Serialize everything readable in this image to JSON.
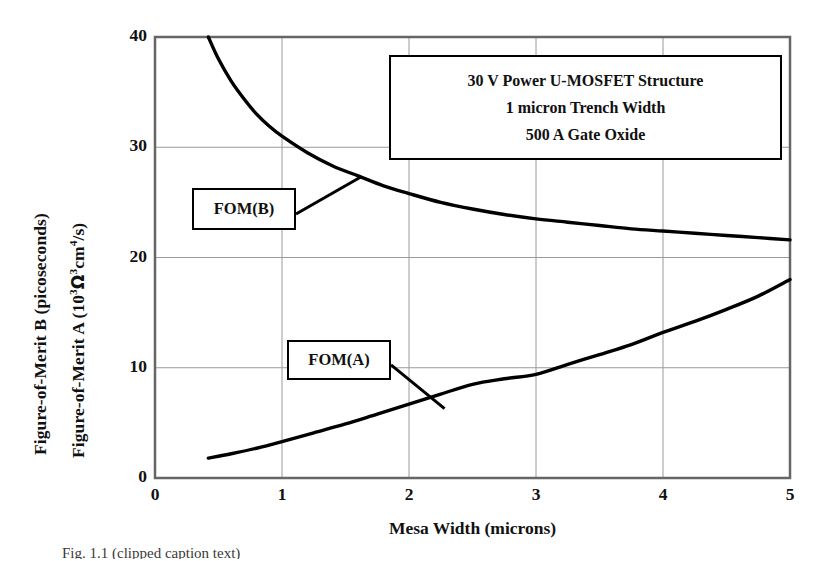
{
  "chart_data": {
    "type": "line",
    "title": "",
    "xlabel": "Mesa Width   (microns)",
    "ylabel_b": "Figure-of-Merit B  (picoseconds)",
    "ylabel_a": "Figure-of-Merit A   (10",
    "ylabel_a_sup": "3",
    "ylabel_a_omega": "Ω",
    "ylabel_a_tail": "cm",
    "ylabel_a_tail_sup": "4",
    "ylabel_a_end": "/s)",
    "xlim": [
      0,
      5
    ],
    "ylim": [
      0,
      40
    ],
    "xticks": [
      "0",
      "1",
      "2",
      "3",
      "4",
      "5"
    ],
    "yticks": [
      "0",
      "10",
      "20",
      "30",
      "40"
    ],
    "grid": true,
    "legend_position": "inline-callouts",
    "series": [
      {
        "name": "FOM(B)",
        "units": "picoseconds",
        "x": [
          0.42,
          0.5,
          0.6,
          0.7,
          0.8,
          0.9,
          1.0,
          1.2,
          1.4,
          1.6,
          1.8,
          2.0,
          2.25,
          2.5,
          2.75,
          3.0,
          3.25,
          3.5,
          3.75,
          4.0,
          4.25,
          4.5,
          4.75,
          5.0
        ],
        "y": [
          40.0,
          38.0,
          36.0,
          34.4,
          33.0,
          31.9,
          31.0,
          29.5,
          28.3,
          27.4,
          26.5,
          25.8,
          25.0,
          24.4,
          23.9,
          23.5,
          23.2,
          22.9,
          22.6,
          22.4,
          22.2,
          22.0,
          21.8,
          21.6
        ]
      },
      {
        "name": "FOM(A)",
        "units": "10^3 Ohm^2 cm^4 /s",
        "x": [
          0.42,
          0.6,
          0.8,
          1.0,
          1.25,
          1.5,
          1.75,
          2.0,
          2.25,
          2.5,
          2.75,
          3.0,
          3.25,
          3.5,
          3.75,
          4.0,
          4.25,
          4.5,
          4.75,
          5.0
        ],
        "y": [
          1.8,
          2.2,
          2.7,
          3.3,
          4.1,
          4.9,
          5.8,
          6.7,
          7.6,
          8.5,
          9.0,
          9.4,
          10.3,
          11.2,
          12.1,
          13.2,
          14.2,
          15.3,
          16.5,
          18.0
        ]
      }
    ],
    "annotations": [
      {
        "id": "fom-b",
        "label": "FOM(B)",
        "points_to_x": 1.62,
        "points_to_y": 27.3
      },
      {
        "id": "fom-a",
        "label": "FOM(A)",
        "points_to_x": 2.28,
        "points_to_y": 6.3
      }
    ],
    "infobox": {
      "line1": "30 V Power U-MOSFET Structure",
      "line2": "1 micron Trench Width",
      "line3": "500 A Gate Oxide"
    }
  },
  "caption": "Fig. 1.1  (clipped caption text)",
  "colors": {
    "curve": "#000000",
    "grid": "#999999",
    "axis": "#555555",
    "background": "#ffffff"
  }
}
